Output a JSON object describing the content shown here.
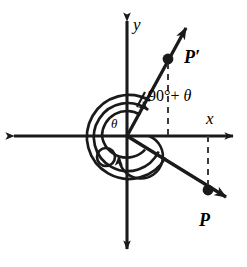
{
  "figure": {
    "type": "coordinate-plane-angle-diagram",
    "background_color": "#ffffff",
    "ink_color": "#1a1a1a"
  },
  "axes": {
    "x_label": "x",
    "y_label": "y",
    "origin": {
      "x": 127,
      "y": 136
    },
    "x_axis": {
      "x1": 12,
      "y1": 136,
      "x2": 236,
      "y2": 136,
      "arrows": "both"
    },
    "y_axis": {
      "x1": 127,
      "y1": 18,
      "x2": 127,
      "y2": 252,
      "arrows": "both"
    }
  },
  "points": [
    {
      "name": "P",
      "label": "P",
      "x": 208,
      "y": 190,
      "quadrant": "IV",
      "dot_radius": 5
    },
    {
      "name": "P-prime",
      "label": "P′",
      "x": 168,
      "y": 59,
      "quadrant": "I",
      "dot_radius": 5
    }
  ],
  "rays": [
    {
      "name": "ray-to-P",
      "from_origin": true,
      "through": "P",
      "end": {
        "x": 232,
        "y": 200
      },
      "arrow": true
    },
    {
      "name": "ray-to-P-prime",
      "from_origin": true,
      "through": "P-prime",
      "end": {
        "x": 190,
        "y": 22
      },
      "arrow": true
    }
  ],
  "dashed_segments": [
    {
      "name": "dashed-drop-p-prime",
      "from": {
        "x": 168,
        "y": 62
      },
      "to": {
        "x": 168,
        "y": 136
      }
    },
    {
      "name": "dashed-drop-p",
      "from": {
        "x": 208,
        "y": 136
      },
      "to": {
        "x": 208,
        "y": 188
      }
    }
  ],
  "angles": [
    {
      "name": "angle-theta",
      "label": "θ",
      "description": "inner arc from positive x-axis sweeping clockwise to the terminal ray through P",
      "arc_radius": 22
    },
    {
      "name": "angle-ninety-plus-theta",
      "label_prefix": "90°+ ",
      "label_symbol": "θ",
      "label_full": "90°+ θ",
      "description": "outer spiral arc sweeping from the terminal ray through P counterclockwise past the axes to the terminal ray through P prime",
      "arc_radius": 40
    }
  ],
  "labels": {
    "x_axis": "x",
    "y_axis": "y",
    "point_p": "P",
    "point_p_prime": "P′",
    "theta": "θ",
    "angle_expression_prefix": "90°+ ",
    "angle_expression_theta": "θ"
  }
}
